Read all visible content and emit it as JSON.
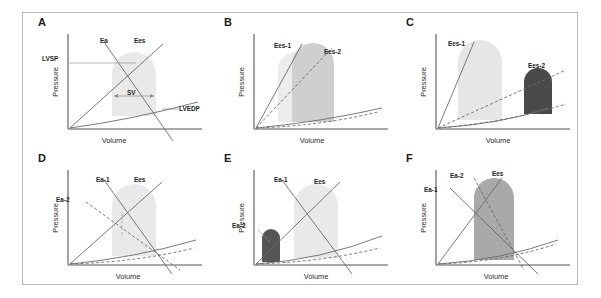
{
  "figure": {
    "type": "scientific-figure",
    "panel_count": 6,
    "background": "#ffffff",
    "frame_color": "#b9b9b9"
  },
  "axes": {
    "x_label": "Volume",
    "y_label": "Pressure",
    "axis_color": "#555555"
  },
  "colors": {
    "loop_light": "#e8e8e8",
    "loop_medium": "#c9c9c9",
    "loop_dark": "#4a4a4a",
    "loop_mid_dark": "#9a9a9a",
    "line": "#6b6b6b",
    "line_dark": "#4a4a4a",
    "text": "#1a1a1a"
  },
  "panels": [
    {
      "id": "A",
      "letter": "A",
      "x_label": "Volume",
      "y_label": "Pressure",
      "loops": [
        {
          "name": "baseline-loop",
          "shade": "light"
        }
      ],
      "annotations": [
        {
          "name": "ea-label",
          "text": "Ea",
          "x": 78,
          "y": 25
        },
        {
          "name": "ees-label",
          "text": "Ees",
          "x": 112,
          "y": 25
        },
        {
          "name": "lvsp-label",
          "text": "LVSP",
          "x": 38,
          "y": 44
        },
        {
          "name": "sv-label",
          "text": "SV",
          "x": 112,
          "y": 88
        },
        {
          "name": "lvedp-label",
          "text": "LVEDP",
          "x": 150,
          "y": 102
        }
      ]
    },
    {
      "id": "B",
      "letter": "B",
      "x_label": "Volume",
      "y_label": "Pressure",
      "loops": [
        {
          "name": "loop-1",
          "shade": "light"
        },
        {
          "name": "loop-2",
          "shade": "medium"
        }
      ],
      "annotations": [
        {
          "name": "ees1-label",
          "text": "Ees-1",
          "x": 62,
          "y": 30
        },
        {
          "name": "ees2-label",
          "text": "Ees-2",
          "x": 112,
          "y": 36
        }
      ]
    },
    {
      "id": "C",
      "letter": "C",
      "x_label": "Volume",
      "y_label": "Pressure",
      "loops": [
        {
          "name": "loop-1",
          "shade": "light"
        },
        {
          "name": "loop-2",
          "shade": "dark"
        }
      ],
      "annotations": [
        {
          "name": "ees1-label",
          "text": "Ees-1",
          "x": 54,
          "y": 28
        },
        {
          "name": "ees2-label",
          "text": "Ees-2",
          "x": 140,
          "y": 50
        }
      ]
    },
    {
      "id": "D",
      "letter": "D",
      "x_label": "Volume",
      "y_label": "Pressure",
      "loops": [
        {
          "name": "loop-1",
          "shade": "light"
        }
      ],
      "annotations": [
        {
          "name": "ea1-label",
          "text": "Ea-1",
          "x": 76,
          "y": 28
        },
        {
          "name": "ees-label",
          "text": "Ees",
          "x": 112,
          "y": 28
        },
        {
          "name": "ea2-label",
          "text": "Ea-2",
          "x": 40,
          "y": 48
        }
      ]
    },
    {
      "id": "E",
      "letter": "E",
      "x_label": "Volume",
      "y_label": "Pressure",
      "loops": [
        {
          "name": "loop-1",
          "shade": "light"
        },
        {
          "name": "loop-2",
          "shade": "dark"
        }
      ],
      "annotations": [
        {
          "name": "ea1-label",
          "text": "Ea-1",
          "x": 68,
          "y": 26
        },
        {
          "name": "ees-label",
          "text": "Ees",
          "x": 106,
          "y": 28
        },
        {
          "name": "ea2-label",
          "text": "Ea-2",
          "x": 36,
          "y": 72
        }
      ]
    },
    {
      "id": "F",
      "letter": "F",
      "x_label": "Volume",
      "y_label": "Pressure",
      "loops": [
        {
          "name": "loop-1",
          "shade": "mid-dark"
        }
      ],
      "annotations": [
        {
          "name": "ea2-label",
          "text": "Ea-2",
          "x": 60,
          "y": 22
        },
        {
          "name": "ees-label",
          "text": "Ees",
          "x": 100,
          "y": 20
        },
        {
          "name": "ea1-label",
          "text": "Ea-1",
          "x": 36,
          "y": 36
        }
      ]
    }
  ]
}
